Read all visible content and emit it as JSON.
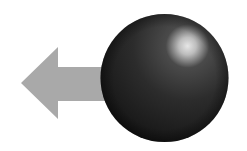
{
  "illustration": {
    "description": "Gray left-pointing arrow behind a dark glossy sphere",
    "arrow": {
      "icon": "arrow-left-icon",
      "color": "#a9a9a9",
      "direction": "left"
    },
    "sphere": {
      "icon": "sphere-icon",
      "base_color": "#2a2a2a",
      "highlight_color": "#e0e0e0"
    },
    "background": "#ffffff"
  }
}
